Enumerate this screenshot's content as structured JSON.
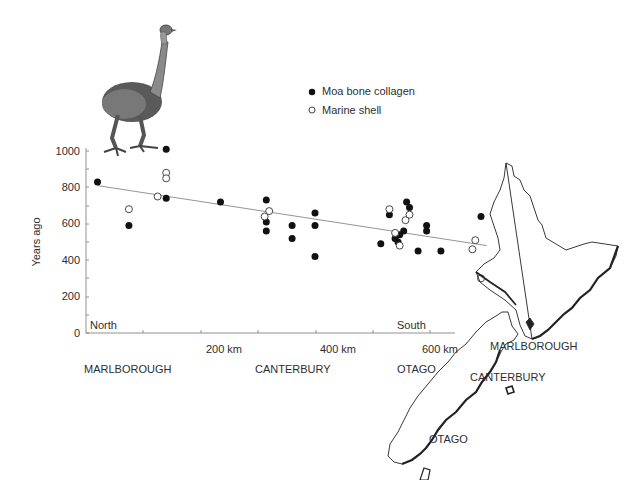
{
  "chart_data": {
    "type": "scatter",
    "title": "",
    "xlabel": "",
    "ylabel": "Years ago",
    "ylim": [
      0,
      1000
    ],
    "xlim": [
      0,
      640
    ],
    "yticks": [
      0,
      200,
      400,
      600,
      800,
      1000
    ],
    "xticks_labels": [
      "200 km",
      "400 km",
      "600 km"
    ],
    "xticks_values": [
      200,
      400,
      600
    ],
    "grid": false,
    "legend_position": "top-center",
    "annotations": {
      "north": "North",
      "south": "South"
    },
    "region_labels": [
      "MARLBOROUGH",
      "CANTERBURY",
      "OTAGO"
    ],
    "series": [
      {
        "name": "Moa bone collagen",
        "marker": "filled-circle",
        "points": [
          [
            20,
            830
          ],
          [
            75,
            590
          ],
          [
            140,
            1010
          ],
          [
            140,
            740
          ],
          [
            235,
            720
          ],
          [
            315,
            730
          ],
          [
            315,
            610
          ],
          [
            315,
            560
          ],
          [
            360,
            590
          ],
          [
            360,
            520
          ],
          [
            400,
            660
          ],
          [
            400,
            590
          ],
          [
            400,
            420
          ],
          [
            515,
            490
          ],
          [
            530,
            650
          ],
          [
            540,
            520
          ],
          [
            545,
            500
          ],
          [
            548,
            540
          ],
          [
            555,
            560
          ],
          [
            560,
            720
          ],
          [
            565,
            690
          ],
          [
            580,
            450
          ],
          [
            595,
            560
          ],
          [
            595,
            590
          ],
          [
            620,
            450
          ],
          [
            690,
            640
          ]
        ]
      },
      {
        "name": "Marine shell",
        "marker": "open-circle",
        "points": [
          [
            75,
            680
          ],
          [
            125,
            750
          ],
          [
            140,
            880
          ],
          [
            140,
            850
          ],
          [
            312,
            640
          ],
          [
            320,
            670
          ],
          [
            530,
            680
          ],
          [
            540,
            550
          ],
          [
            548,
            480
          ],
          [
            558,
            620
          ],
          [
            565,
            650
          ],
          [
            680,
            510
          ],
          [
            675,
            460
          ],
          [
            690,
            300
          ]
        ]
      }
    ],
    "trend_line": {
      "from": [
        20,
        810
      ],
      "to": [
        700,
        480
      ]
    }
  },
  "legend": {
    "items": [
      {
        "label": "Moa bone collagen",
        "marker": "filled-circle"
      },
      {
        "label": "Marine shell",
        "marker": "open-circle"
      }
    ]
  },
  "axes": {
    "y_label": "Years ago",
    "y_ticks": [
      "0",
      "200",
      "400",
      "600",
      "800",
      "1000"
    ],
    "x_ticks": [
      "200 km",
      "400 km",
      "600 km"
    ],
    "north_label": "North",
    "south_label": "South"
  },
  "regions_below_axis": [
    "MARLBOROUGH",
    "CANTERBURY",
    "OTAGO"
  ],
  "map": {
    "labels": [
      "MARLBOROUGH",
      "CANTERBURY",
      "OTAGO"
    ]
  },
  "illustration": {
    "subject": "moa-bird"
  }
}
